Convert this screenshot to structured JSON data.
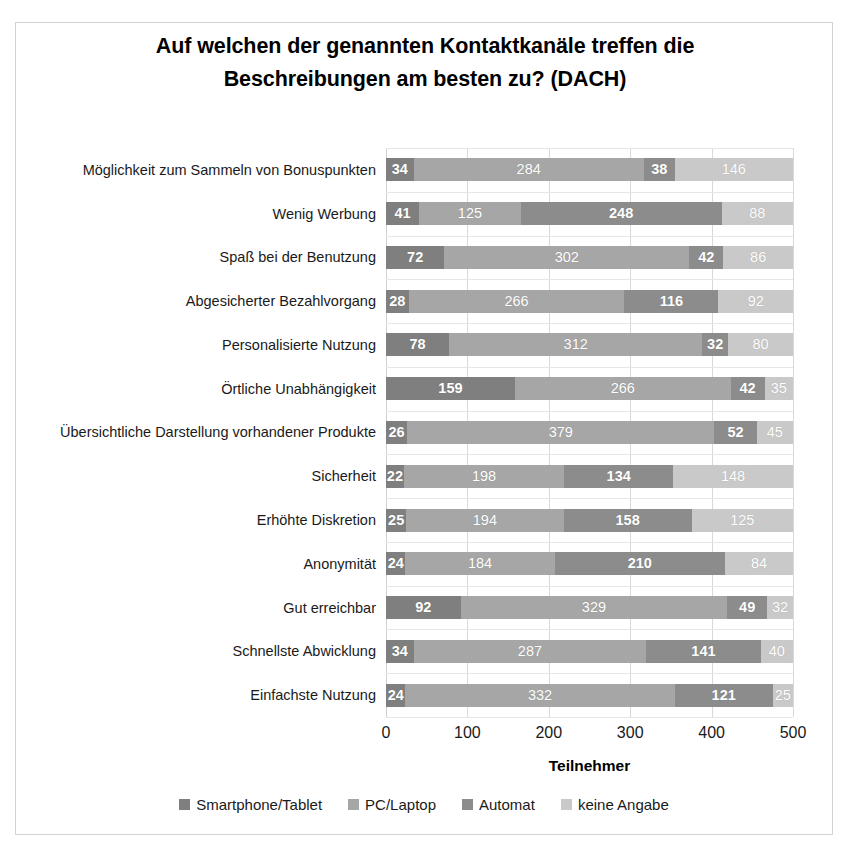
{
  "chart_data": {
    "type": "bar",
    "orientation": "horizontal",
    "stacked": true,
    "title": "Auf welchen der genannten Kontaktkanäle treffen die Beschreibungen am besten zu? (DACH)",
    "title_lines": [
      "Auf welchen der genannten Kontaktkanäle treffen die",
      "Beschreibungen am besten zu? (DACH)"
    ],
    "xlabel": "Teilnehmer",
    "ylabel": "",
    "xlim": [
      0,
      500
    ],
    "xticks": [
      0,
      100,
      200,
      300,
      400,
      500
    ],
    "xtick_labels": [
      "0",
      "100",
      "200",
      "300",
      "400",
      "500"
    ],
    "grid": true,
    "grid_axis": "x",
    "legend_position": "bottom",
    "categories": [
      "Möglichkeit zum Sammeln von Bonuspunkten",
      "Wenig Werbung",
      "Spaß bei der Benutzung",
      "Abgesicherter Bezahlvorgang",
      "Personalisierte Nutzung",
      "Örtliche Unabhängigkeit",
      "Übersichtliche Darstellung vorhandener Produkte",
      "Sicherheit",
      "Erhöhte Diskretion",
      "Anonymität",
      "Gut erreichbar",
      "Schnellste Abwicklung",
      "Einfachste Nutzung"
    ],
    "series": [
      {
        "name": "Smartphone/Tablet",
        "color": "#7f7f7f",
        "values": [
          34,
          41,
          72,
          28,
          78,
          159,
          26,
          22,
          25,
          24,
          92,
          34,
          24
        ]
      },
      {
        "name": "PC/Laptop",
        "color": "#a6a6a6",
        "values": [
          284,
          125,
          302,
          266,
          312,
          266,
          379,
          198,
          194,
          184,
          329,
          287,
          332
        ]
      },
      {
        "name": "Automat",
        "color": "#8c8c8c",
        "values": [
          38,
          248,
          42,
          116,
          32,
          42,
          52,
          134,
          158,
          210,
          49,
          141,
          121
        ]
      },
      {
        "name": "keine Angabe",
        "color": "#c9c9c9",
        "values": [
          146,
          88,
          86,
          92,
          80,
          35,
          45,
          148,
          125,
          84,
          32,
          40,
          25
        ]
      }
    ],
    "row_totals": [
      502,
      502,
      502,
      502,
      502,
      502,
      502,
      502,
      502,
      502,
      502,
      502,
      502
    ]
  },
  "colors": {
    "series_1": "#7f7f7f",
    "series_2": "#a6a6a6",
    "series_3": "#8c8c8c",
    "series_4": "#c9c9c9",
    "gridline": "#d9d9d9",
    "frame": "#d2d2d2",
    "text": "#1a1a1a",
    "value_label": "#ffffff",
    "background": "#ffffff"
  }
}
